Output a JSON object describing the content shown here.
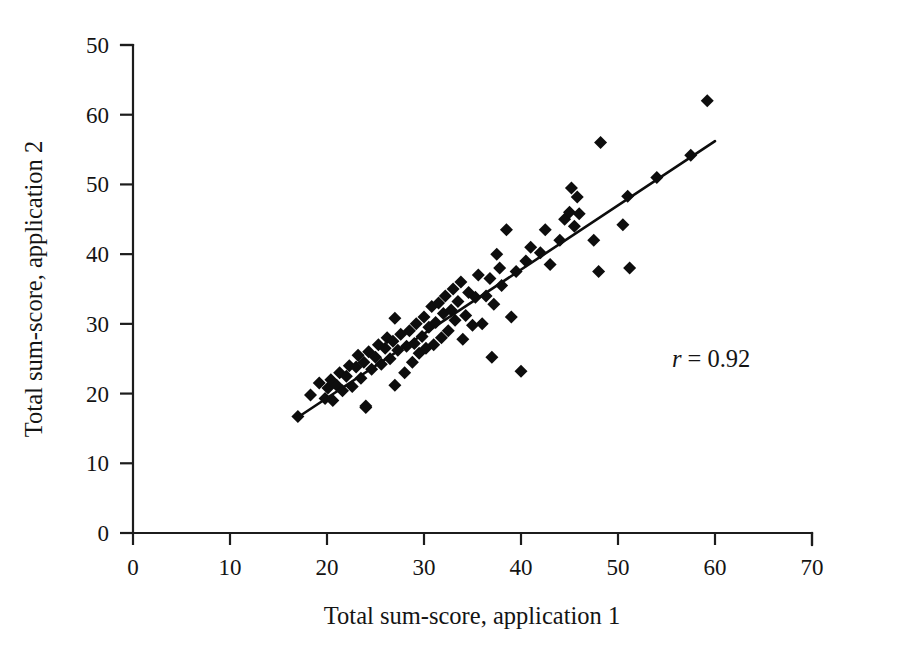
{
  "figure": {
    "background_color": "#ffffff",
    "foreground_color": "#0d0d0d",
    "width": 909,
    "height": 655
  },
  "annotation": {
    "r_symbol": "r",
    "r_equals": "= 0.92",
    "full_text": "r = 0.92"
  },
  "chart_data": {
    "type": "scatter",
    "title": "",
    "xlabel": "Total sum-score, application 1",
    "ylabel": "Total sum-score, application 2",
    "xlim": [
      0,
      70
    ],
    "ylim": [
      0,
      70
    ],
    "xticks": [
      0,
      10,
      20,
      30,
      40,
      50,
      60,
      70
    ],
    "xticklabels": [
      "0",
      "10",
      "20",
      "30",
      "40",
      "50",
      "60",
      "70"
    ],
    "yticks": [
      0,
      10,
      20,
      30,
      40,
      50,
      60,
      70
    ],
    "yticklabels": [
      "0",
      "10",
      "20",
      "30",
      "40",
      "50",
      "60",
      "50"
    ],
    "grid": false,
    "legend": null,
    "marker": "diamond",
    "marker_color": "#0d0d0d",
    "marker_size": 13,
    "annotations": [
      {
        "text": "r = 0.92",
        "x": 52,
        "y": 25
      }
    ],
    "trendline": {
      "type": "linear-fit",
      "x_start": 17.0,
      "y_start": 16.6,
      "x_end": 60.0,
      "y_end": 56.2,
      "color": "#0d0d0d",
      "width": 2.6
    },
    "correlation": 0.92,
    "n_points": 86,
    "x": [
      17.0,
      18.3,
      19.2,
      19.8,
      20.1,
      20.4,
      20.6,
      21.0,
      21.3,
      21.6,
      22.0,
      22.3,
      22.6,
      23.0,
      23.2,
      23.5,
      23.8,
      24.0,
      24.0,
      24.3,
      24.6,
      25.0,
      25.3,
      25.6,
      26.0,
      26.2,
      26.5,
      26.8,
      27.0,
      27.0,
      27.3,
      27.6,
      28.0,
      28.2,
      28.5,
      28.8,
      29.0,
      29.2,
      29.5,
      29.8,
      30.0,
      30.2,
      30.5,
      30.8,
      31.0,
      31.2,
      31.5,
      31.8,
      32.0,
      32.2,
      32.5,
      32.8,
      33.0,
      33.2,
      33.5,
      33.8,
      34.0,
      34.3,
      34.6,
      35.0,
      35.3,
      35.6,
      36.0,
      36.4,
      36.8,
      37.0,
      37.2,
      37.5,
      37.8,
      38.0,
      38.5,
      39.0,
      39.5,
      40.0,
      40.5,
      41.0,
      42.0,
      42.5,
      43.0,
      44.0,
      44.5,
      45.0,
      45.2,
      45.5,
      45.8,
      46.0,
      47.5,
      48.0,
      48.2,
      50.5,
      51.0,
      51.2,
      54.0,
      57.5,
      59.2
    ],
    "y": [
      16.7,
      19.8,
      21.5,
      19.3,
      20.8,
      22.0,
      19.0,
      21.2,
      23.0,
      20.4,
      22.5,
      24.0,
      21.0,
      23.8,
      25.5,
      22.2,
      24.5,
      18.0,
      18.2,
      26.0,
      23.5,
      25.2,
      27.0,
      24.2,
      26.5,
      28.0,
      25.0,
      27.5,
      21.2,
      30.8,
      26.2,
      28.5,
      23.0,
      26.8,
      29.0,
      24.5,
      27.2,
      30.0,
      25.8,
      28.2,
      31.0,
      26.5,
      29.5,
      32.5,
      27.0,
      30.2,
      33.0,
      28.0,
      31.5,
      34.0,
      29.0,
      32.0,
      35.0,
      30.5,
      33.2,
      36.0,
      27.8,
      31.2,
      34.5,
      29.8,
      33.8,
      37.0,
      30.0,
      34.0,
      36.5,
      25.2,
      32.8,
      40.0,
      38.0,
      35.5,
      43.5,
      31.0,
      37.5,
      23.2,
      39.0,
      41.0,
      40.2,
      43.5,
      38.5,
      42.0,
      45.0,
      46.0,
      49.5,
      44.0,
      48.2,
      45.8,
      42.0,
      37.5,
      56.0,
      44.2,
      48.3,
      38.0,
      51.0,
      54.2,
      62.0
    ]
  }
}
